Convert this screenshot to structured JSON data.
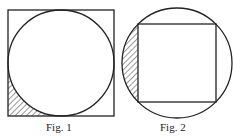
{
  "figures": [
    {
      "id": "fig1",
      "caption": "Fig. 1",
      "description": "Circle inscribed in a square; bottom-left corner region between square and circle is hatched"
    },
    {
      "id": "fig2",
      "caption": "Fig. 2",
      "description": "Square inscribed in a circle; left circular segment outside the square is hatched"
    }
  ],
  "colors": {
    "stroke": "#222222",
    "background": "#ffffff"
  }
}
